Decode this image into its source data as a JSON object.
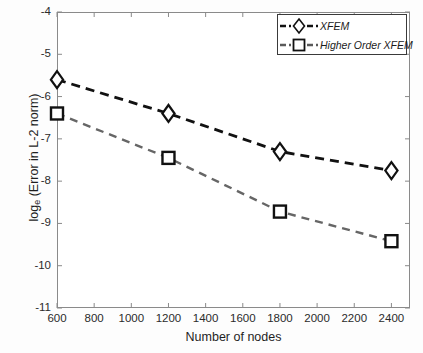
{
  "chart_data": {
    "type": "line",
    "title": "",
    "xlabel": "Number of nodes",
    "ylabel": "log_e  (Error in L-2 norm)",
    "ylabel_base": "log",
    "ylabel_sub": "e",
    "ylabel_rest": "  (Error in L-2 norm)",
    "x": [
      600,
      1200,
      1800,
      2400
    ],
    "xlim": [
      600,
      2500
    ],
    "ylim": [
      -11,
      -4
    ],
    "xticks": [
      600,
      800,
      1000,
      1200,
      1400,
      1600,
      1800,
      2000,
      2200,
      2400
    ],
    "yticks": [
      -4,
      -5,
      -6,
      -7,
      -8,
      -9,
      -10,
      -11
    ],
    "xtick_labels": [
      "600",
      "800",
      "1000",
      "1200",
      "1400",
      "1600",
      "1800",
      "2000",
      "2200",
      "2400"
    ],
    "ytick_labels": [
      "-4",
      "-5",
      "-6",
      "-7",
      "-8",
      "-9",
      "-10",
      "-11"
    ],
    "grid": false,
    "legend_position": "top-right",
    "series": [
      {
        "name": "XFEM",
        "marker": "diamond",
        "color": "#111111",
        "linestyle": "dashed",
        "values": [
          -5.6,
          -6.4,
          -7.3,
          -7.75
        ]
      },
      {
        "name": "Higher Order XFEM",
        "marker": "square",
        "color": "#666666",
        "linestyle": "dashed",
        "values": [
          -6.4,
          -7.45,
          -8.72,
          -9.42
        ]
      }
    ]
  },
  "legend": {
    "items": [
      {
        "label": "XFEM"
      },
      {
        "label": "Higher Order XFEM"
      }
    ]
  }
}
